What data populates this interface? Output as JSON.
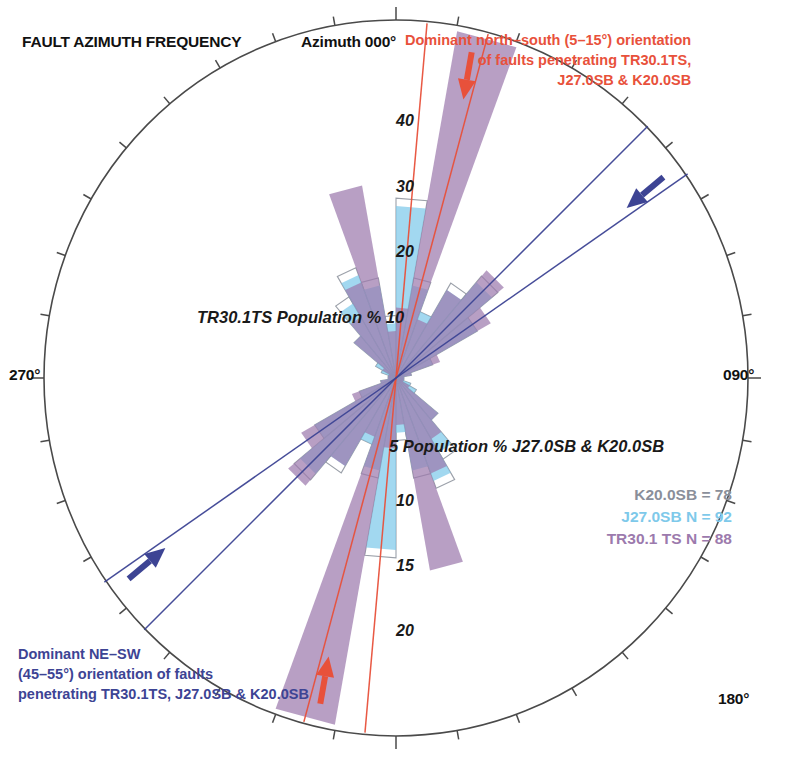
{
  "title": "FAULT AZIMUTH FREQUENCY",
  "compass": {
    "north": "Azimuth 000°",
    "east": "090°",
    "west": "270°",
    "south": "180°"
  },
  "annotations": {
    "red": "Dominant north–south (5–15°) orientation\nof faults penetrating TR30.1TS,\nJ27.0SB & K20.0SB",
    "red_line1": "Dominant north–south (5–15°) orientation",
    "red_line2": "of faults penetrating TR30.1TS,",
    "red_line3": "J27.0SB & K20.0SB",
    "blue_line1": "Dominant NE–SW",
    "blue_line2": "(45–55°) orientation of faults",
    "blue_line3": "penetrating TR30.1TS, J27.0SB & K20.0SB"
  },
  "axis_labels": {
    "top": "TR30.1TS Population % 10",
    "bottom": "5 Population % J27.0SB & K20.0SB"
  },
  "radial_ticks": {
    "upper": [
      "40",
      "30",
      "20"
    ],
    "lower": [
      "10",
      "15",
      "20"
    ]
  },
  "legend": [
    {
      "label": "K20.0SB = 78",
      "color": "#8a8f9a"
    },
    {
      "label": "J27.0SB N = 92",
      "color": "#7ec9ea"
    },
    {
      "label": "TR30.1 TS N = 88",
      "color": "#9c7aad"
    }
  ],
  "colors": {
    "purple": "#9c7aad",
    "light_blue": "#7ec9ea",
    "grey_outline": "#8a8f9a",
    "red_accent": "#e8513b",
    "blue_accent": "#3d4494",
    "circle_stroke": "#4a4a4a"
  },
  "chart_data": {
    "type": "rose",
    "title": "FAULT AZIMUTH FREQUENCY",
    "center": [
      396,
      378
    ],
    "outer_radius": 352,
    "bin_width_deg": 10,
    "radial_axis": {
      "label_top": "TR30.1TS Population % 10",
      "label_bottom": "5 Population % J27.0SB & K20.0SB",
      "max_percent": 45,
      "ticks_percent": [
        5,
        10,
        15,
        20,
        25,
        30,
        35,
        40,
        45
      ]
    },
    "series": [
      {
        "name": "TR30.1 TS",
        "n": 88,
        "color": "#9c7aad",
        "style": "fill",
        "bins_deg": [
          0,
          10,
          20,
          30,
          40,
          50,
          60,
          70,
          80,
          90,
          100,
          110,
          120,
          130,
          140,
          150,
          160,
          170
        ],
        "values_percent": [
          9.0,
          45.0,
          8.0,
          13.0,
          18.0,
          14.0,
          6.0,
          2.0,
          1.0,
          1.0,
          1.0,
          1.0,
          2.0,
          7.0,
          9.0,
          13.0,
          25.0,
          6.0
        ]
      },
      {
        "name": "J27.0SB",
        "n": 92,
        "color": "#7ec9ea",
        "style": "fill",
        "bins_deg": [
          0,
          10,
          20,
          30,
          40,
          50,
          60,
          70,
          80,
          90,
          100,
          110,
          120,
          130,
          140,
          150,
          160,
          170
        ],
        "values_percent": [
          22.0,
          12.0,
          9.0,
          13.0,
          16.0,
          12.0,
          5.0,
          2.0,
          1.0,
          1.0,
          1.0,
          2.0,
          3.0,
          7.0,
          11.0,
          14.0,
          12.0,
          7.0
        ]
      },
      {
        "name": "K20.0SB",
        "n": 78,
        "color": "#8a8f9a",
        "style": "outline",
        "bins_deg": [
          0,
          10,
          20,
          30,
          40,
          50,
          60,
          70,
          80,
          90,
          100,
          110,
          120,
          130,
          140,
          150,
          160,
          170
        ],
        "values_percent": [
          23.0,
          13.0,
          9.0,
          14.0,
          17.0,
          12.0,
          5.0,
          2.0,
          1.0,
          1.0,
          1.0,
          2.0,
          3.0,
          7.0,
          12.0,
          15.0,
          13.0,
          8.0
        ]
      }
    ],
    "marker_lines": [
      {
        "name": "north-south-range",
        "color": "#e8513b",
        "azimuths_deg": [
          5,
          15
        ]
      },
      {
        "name": "ne-sw-range",
        "color": "#3d4494",
        "azimuths_deg": [
          45,
          55
        ]
      }
    ],
    "arrows": [
      {
        "name": "red-arrow-north",
        "color": "#e8513b",
        "azimuth_deg": 10,
        "points": "inward"
      },
      {
        "name": "red-arrow-south",
        "color": "#e8513b",
        "azimuth_deg": 190,
        "points": "inward"
      },
      {
        "name": "blue-arrow-ne",
        "color": "#3d4494",
        "azimuth_deg": 50,
        "points": "inward"
      },
      {
        "name": "blue-arrow-sw",
        "color": "#3d4494",
        "azimuth_deg": 230,
        "points": "inward"
      }
    ]
  }
}
